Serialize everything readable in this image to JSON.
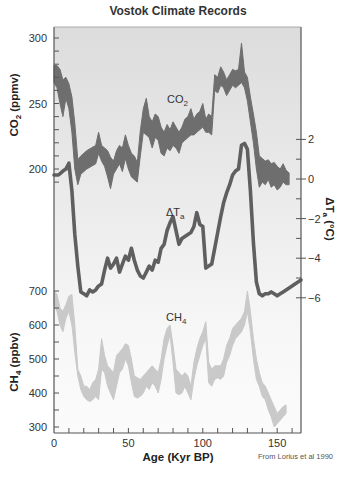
{
  "chart_data": {
    "type": "line",
    "title": "Vostok Climate Records",
    "xlabel": "Age (Kyr BP)",
    "xlim": [
      0,
      166
    ],
    "x_ticks": [
      0,
      50,
      100,
      150
    ],
    "credit": "From Lorius et al 1990",
    "series": [
      {
        "name": "CO2",
        "label": "CO₂",
        "axis": "left-upper",
        "axis_label": "CO₂ (ppmv)",
        "ylim": [
          182,
          309
        ],
        "y_ticks": [
          200,
          250,
          300
        ],
        "style": "band",
        "color": "#6e6e6e",
        "x": [
          0,
          2,
          4,
          6,
          8,
          10,
          12,
          14,
          16,
          18,
          20,
          22,
          25,
          28,
          30,
          32,
          34,
          36,
          38,
          40,
          42,
          44,
          46,
          48,
          50,
          52,
          54,
          56,
          58,
          60,
          62,
          64,
          66,
          68,
          70,
          72,
          74,
          76,
          78,
          80,
          82,
          84,
          86,
          88,
          90,
          92,
          94,
          96,
          98,
          100,
          102,
          104,
          106,
          108,
          110,
          112,
          114,
          116,
          118,
          120,
          122,
          124,
          126,
          128,
          130,
          132,
          134,
          136,
          138,
          140,
          142,
          144,
          146,
          148,
          150,
          152,
          154,
          156,
          158
        ],
        "upper": [
          279,
          279,
          276,
          268,
          270,
          265,
          255,
          235,
          207,
          210,
          212,
          214,
          216,
          218,
          228,
          218,
          216,
          214,
          209,
          206,
          214,
          218,
          216,
          226,
          218,
          212,
          210,
          205,
          229,
          246,
          254,
          240,
          236,
          242,
          240,
          232,
          228,
          234,
          230,
          236,
          232,
          228,
          232,
          238,
          240,
          246,
          238,
          242,
          244,
          250,
          238,
          242,
          240,
          272,
          270,
          278,
          274,
          268,
          272,
          276,
          275,
          276,
          296,
          274,
          270,
          255,
          242,
          228,
          210,
          208,
          206,
          207,
          204,
          205,
          202,
          200,
          204,
          199,
          197
        ],
        "lower": [
          266,
          262,
          250,
          240,
          254,
          246,
          228,
          200,
          188,
          196,
          198,
          200,
          202,
          204,
          212,
          206,
          202,
          194,
          185,
          196,
          200,
          204,
          198,
          208,
          200,
          194,
          192,
          190,
          210,
          228,
          226,
          224,
          216,
          224,
          222,
          212,
          210,
          216,
          214,
          218,
          216,
          212,
          220,
          222,
          224,
          226,
          226,
          228,
          230,
          232,
          228,
          228,
          226,
          260,
          258,
          264,
          262,
          256,
          260,
          264,
          262,
          264,
          266,
          262,
          252,
          236,
          220,
          200,
          186,
          190,
          188,
          192,
          186,
          188,
          184,
          186,
          190,
          188,
          188
        ]
      },
      {
        "name": "Delta Ta",
        "label": "ΔTa",
        "axis": "right-middle",
        "axis_label": "ΔTa (°C)",
        "unit": "°C",
        "ylim": [
          -6.2,
          3
        ],
        "y_ticks": [
          2,
          0,
          -2,
          -4,
          -6
        ],
        "style": "thick-line",
        "color": "#5f5f5f",
        "x": [
          0,
          3,
          6,
          8,
          10,
          12,
          14,
          16,
          18,
          20,
          22,
          24,
          26,
          28,
          30,
          32,
          34,
          36,
          38,
          40,
          42,
          44,
          46,
          48,
          50,
          52,
          54,
          56,
          58,
          60,
          62,
          64,
          66,
          68,
          70,
          72,
          74,
          76,
          78,
          80,
          82,
          84,
          86,
          88,
          90,
          92,
          94,
          96,
          98,
          100,
          102,
          104,
          106,
          108,
          110,
          112,
          114,
          116,
          118,
          120,
          122,
          124,
          126,
          128,
          130,
          132,
          134,
          136,
          138,
          140,
          142,
          144,
          146,
          148,
          150,
          152,
          154,
          156,
          158,
          160,
          162,
          164,
          166
        ],
        "values": [
          0.2,
          0.2,
          0.4,
          0.5,
          0.8,
          -0.6,
          -2.8,
          -4.4,
          -5.7,
          -5.8,
          -5.9,
          -5.6,
          -5.7,
          -5.6,
          -5.4,
          -5.3,
          -4.6,
          -4.0,
          -4.5,
          -4.3,
          -4.0,
          -4.7,
          -4.3,
          -3.9,
          -4.1,
          -3.5,
          -4.1,
          -4.6,
          -4.9,
          -5.0,
          -4.7,
          -4.4,
          -4.6,
          -4.1,
          -4.2,
          -3.5,
          -3.3,
          -2.6,
          -2.2,
          -1.9,
          -2.6,
          -3.3,
          -3.0,
          -2.9,
          -2.8,
          -2.7,
          -2.4,
          -1.7,
          -2.3,
          -2.4,
          -4.5,
          -4.4,
          -4.3,
          -3.5,
          -2.7,
          -1.9,
          -1.2,
          -0.7,
          -0.3,
          0.2,
          0.4,
          0.5,
          1.7,
          1.8,
          1.5,
          -0.6,
          -3.2,
          -5.2,
          -5.8,
          -5.9,
          -5.8,
          -5.8,
          -5.7,
          -5.8,
          -5.9,
          -5.8,
          -5.7,
          -5.6,
          -5.5,
          -5.4,
          -5.3,
          -5.2,
          -5.1
        ]
      },
      {
        "name": "CH4",
        "label": "CH₄",
        "axis": "left-lower",
        "axis_label": "CH₄ (ppbv)",
        "ylim": [
          300,
          700
        ],
        "y_ticks": [
          300,
          400,
          500,
          600,
          700
        ],
        "style": "band",
        "color": "#c9c9c9",
        "x": [
          0,
          2,
          4,
          6,
          8,
          10,
          12,
          14,
          16,
          18,
          20,
          22,
          24,
          26,
          28,
          30,
          32,
          34,
          36,
          38,
          40,
          42,
          44,
          46,
          48,
          50,
          52,
          54,
          56,
          58,
          60,
          62,
          64,
          66,
          68,
          70,
          72,
          74,
          76,
          78,
          80,
          82,
          84,
          86,
          88,
          90,
          92,
          94,
          96,
          98,
          100,
          102,
          104,
          106,
          108,
          110,
          112,
          114,
          116,
          118,
          120,
          122,
          124,
          126,
          128,
          130,
          132,
          134,
          136,
          138,
          140,
          142,
          144,
          146,
          148,
          150,
          152,
          154,
          156
        ],
        "upper": [
          700,
          690,
          650,
          640,
          660,
          685,
          690,
          600,
          470,
          450,
          420,
          420,
          410,
          430,
          440,
          470,
          560,
          510,
          480,
          470,
          460,
          510,
          520,
          530,
          545,
          540,
          500,
          450,
          445,
          440,
          450,
          460,
          470,
          480,
          470,
          460,
          500,
          560,
          590,
          600,
          540,
          470,
          460,
          450,
          460,
          450,
          420,
          490,
          530,
          560,
          580,
          610,
          490,
          470,
          480,
          480,
          480,
          500,
          540,
          560,
          590,
          600,
          610,
          620,
          640,
          700,
          640,
          560,
          500,
          460,
          430,
          420,
          400,
          380,
          360,
          340,
          350,
          360,
          365
        ],
        "lower": [
          660,
          640,
          600,
          580,
          620,
          640,
          600,
          520,
          450,
          410,
          390,
          380,
          375,
          380,
          390,
          380,
          470,
          460,
          420,
          400,
          380,
          420,
          460,
          470,
          500,
          480,
          430,
          390,
          385,
          390,
          400,
          420,
          410,
          430,
          420,
          400,
          440,
          500,
          540,
          570,
          490,
          400,
          395,
          400,
          420,
          400,
          380,
          440,
          480,
          510,
          540,
          560,
          430,
          420,
          440,
          445,
          440,
          450,
          490,
          510,
          540,
          560,
          570,
          580,
          600,
          640,
          580,
          500,
          440,
          420,
          390,
          380,
          350,
          330,
          300,
          310,
          320,
          330,
          340
        ]
      }
    ]
  },
  "labels": {
    "title": "Vostok Climate Records",
    "co2_axis": "CO₂ (ppmv)",
    "ch4_axis": "CH₄ (ppbv)",
    "temp_axis": "ΔTa (°C)",
    "x_axis": "Age (Kyr BP)",
    "co2_series": "CO₂",
    "temp_series": "ΔTa",
    "ch4_series": "CH₄",
    "credit": "From Lorius et al 1990"
  }
}
